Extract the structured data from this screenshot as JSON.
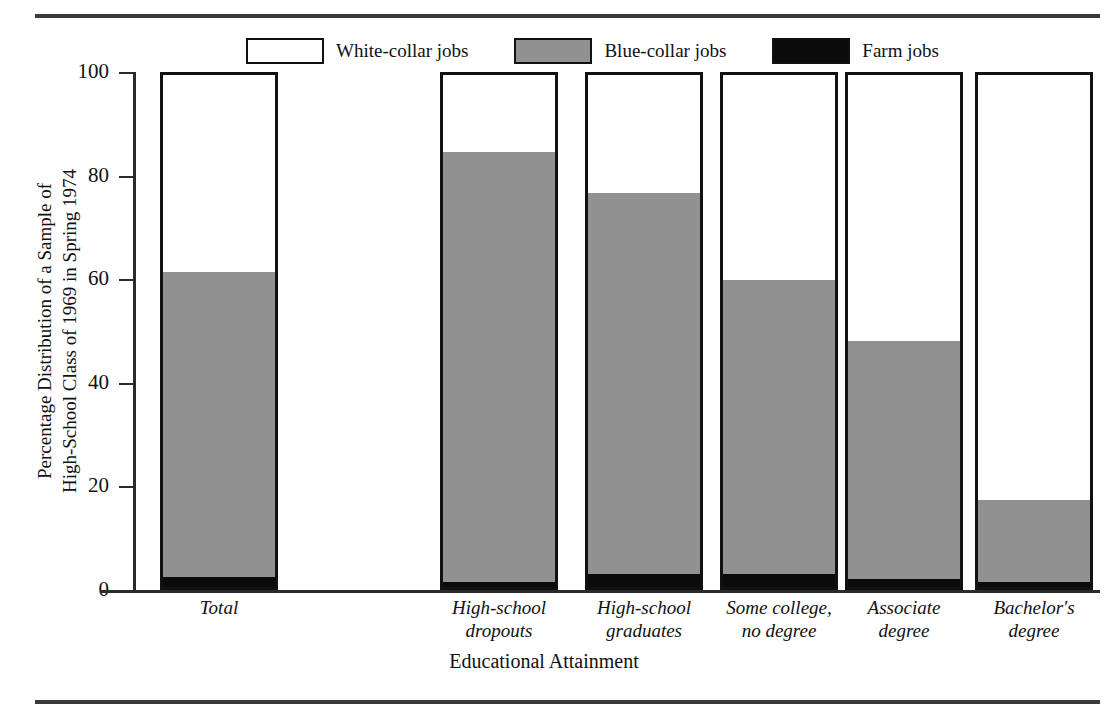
{
  "chart_data": {
    "type": "bar",
    "subtype": "stacked-100-percent",
    "title": "",
    "xlabel": "Educational Attainment",
    "ylabel": "Percentage Distribution of a Sample of High-School Class of 1969 in Spring 1974",
    "ylabel_lines": [
      "Percentage Distribution of a Sample of",
      "High-School Class of 1969 in Spring 1974"
    ],
    "ylim": [
      0,
      100
    ],
    "yticks": [
      0,
      20,
      40,
      60,
      80,
      100
    ],
    "ytick_labels": [
      "0",
      "20",
      "40",
      "60",
      "80",
      "100"
    ],
    "grid": false,
    "legend_position": "top",
    "categories": [
      "Total",
      "High-school dropouts",
      "High-school graduates",
      "Some college, no degree",
      "Associate degree",
      "Bachelor's degree"
    ],
    "category_label_lines": [
      [
        "Total"
      ],
      [
        "High-school",
        "dropouts"
      ],
      [
        "High-school",
        "graduates"
      ],
      [
        "Some college,",
        "no degree"
      ],
      [
        "Associate",
        "degree"
      ],
      [
        "Bachelor's",
        "degree"
      ]
    ],
    "series": [
      {
        "name": "White-collar jobs",
        "color": "#ffffff",
        "values": [
          38.5,
          15.0,
          23.0,
          40.0,
          52.0,
          83.0
        ]
      },
      {
        "name": "Blue-collar jobs",
        "color": "#919191",
        "values": [
          59.5,
          84.0,
          74.5,
          57.5,
          46.5,
          16.0
        ]
      },
      {
        "name": "Farm jobs",
        "color": "#0b0b0b",
        "values": [
          2.0,
          1.0,
          2.5,
          2.5,
          1.5,
          1.0
        ]
      }
    ],
    "stack_order_bottom_to_top": [
      "Farm jobs",
      "Blue-collar jobs",
      "White-collar jobs"
    ],
    "cumulative_tops": {
      "farm": [
        2.0,
        1.0,
        2.5,
        2.5,
        1.5,
        1.0
      ],
      "blue": [
        61.5,
        85.0,
        77.0,
        60.0,
        48.0,
        17.0
      ],
      "white": [
        100,
        100,
        100,
        100,
        100,
        100
      ]
    },
    "bar_left_positions_px": [
      160,
      440,
      585,
      720,
      845,
      975
    ],
    "colors": {
      "white_collar": "#ffffff",
      "blue_collar": "#919191",
      "farm": "#0b0b0b",
      "axis": "#2b2b2b",
      "rule": "#3a3a3a"
    }
  },
  "legend": {
    "items": [
      {
        "label": "White-collar jobs",
        "swatch": "white"
      },
      {
        "label": "Blue-collar jobs",
        "swatch": "gray"
      },
      {
        "label": "Farm jobs",
        "swatch": "black"
      }
    ]
  }
}
